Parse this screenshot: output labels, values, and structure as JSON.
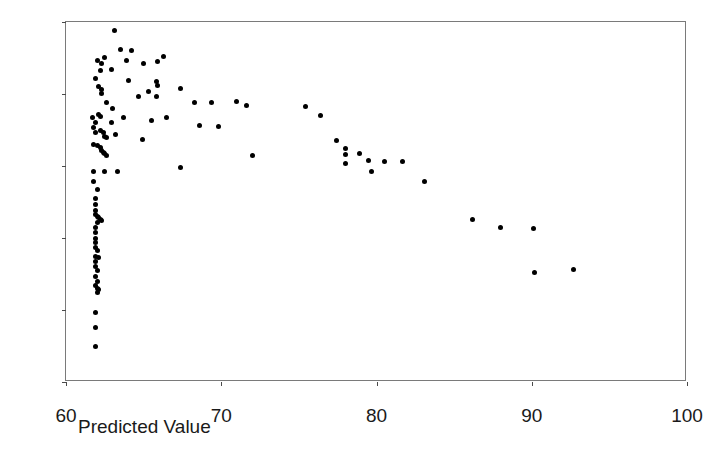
{
  "chart_data": {
    "type": "scatter",
    "title": "",
    "xlabel": "Predicted Value",
    "ylabel": "Studentized Residual",
    "xlim": [
      60,
      100
    ],
    "ylim": [
      -3,
      2
    ],
    "xticks": [
      60,
      70,
      80,
      90,
      100
    ],
    "yticks": [
      2,
      1,
      0,
      -1,
      -2,
      -3
    ],
    "xtick_labels": [
      "60",
      "70",
      "80",
      "90",
      "100"
    ],
    "ytick_labels": [
      "2",
      "1",
      "0",
      "-1",
      "-2",
      "-3"
    ],
    "grid": false,
    "legend": null,
    "marker": "filled-circle",
    "marker_color": "#000000",
    "n_points": 108,
    "points": [
      [
        63.1,
        1.88
      ],
      [
        63.5,
        1.62
      ],
      [
        64.2,
        1.6
      ],
      [
        62.0,
        1.47
      ],
      [
        62.5,
        1.51
      ],
      [
        66.3,
        1.52
      ],
      [
        62.3,
        1.43
      ],
      [
        63.9,
        1.46
      ],
      [
        65.0,
        1.43
      ],
      [
        65.9,
        1.45
      ],
      [
        62.2,
        1.33
      ],
      [
        62.9,
        1.34
      ],
      [
        61.9,
        1.21
      ],
      [
        64.0,
        1.19
      ],
      [
        65.8,
        1.17
      ],
      [
        65.9,
        1.12
      ],
      [
        62.1,
        1.11
      ],
      [
        62.3,
        1.06
      ],
      [
        65.3,
        1.04
      ],
      [
        67.4,
        1.07
      ],
      [
        62.3,
        1.01
      ],
      [
        64.7,
        0.97
      ],
      [
        65.8,
        0.96
      ],
      [
        62.6,
        0.88
      ],
      [
        68.3,
        0.88
      ],
      [
        69.4,
        0.88
      ],
      [
        71.0,
        0.9
      ],
      [
        71.6,
        0.84
      ],
      [
        75.4,
        0.82
      ],
      [
        63.0,
        0.8
      ],
      [
        76.4,
        0.7
      ],
      [
        61.7,
        0.68
      ],
      [
        62.1,
        0.71
      ],
      [
        62.2,
        0.69
      ],
      [
        63.7,
        0.68
      ],
      [
        65.5,
        0.63
      ],
      [
        66.5,
        0.67
      ],
      [
        61.9,
        0.6
      ],
      [
        62.9,
        0.6
      ],
      [
        61.8,
        0.54
      ],
      [
        68.6,
        0.56
      ],
      [
        69.8,
        0.55
      ],
      [
        62.2,
        0.5
      ],
      [
        62.4,
        0.46
      ],
      [
        61.9,
        0.47
      ],
      [
        63.2,
        0.44
      ],
      [
        62.5,
        0.41
      ],
      [
        62.6,
        0.4
      ],
      [
        64.9,
        0.37
      ],
      [
        77.4,
        0.35
      ],
      [
        61.8,
        0.3
      ],
      [
        62.0,
        0.29
      ],
      [
        62.2,
        0.26
      ],
      [
        62.3,
        0.22
      ],
      [
        78.0,
        0.25
      ],
      [
        62.4,
        0.19
      ],
      [
        62.5,
        0.17
      ],
      [
        62.6,
        0.15
      ],
      [
        72.0,
        0.14
      ],
      [
        78.0,
        0.16
      ],
      [
        78.9,
        0.17
      ],
      [
        79.5,
        0.07
      ],
      [
        80.5,
        0.06
      ],
      [
        81.7,
        0.06
      ],
      [
        78.0,
        0.03
      ],
      [
        67.4,
        -0.02
      ],
      [
        61.8,
        -0.07
      ],
      [
        62.5,
        -0.07
      ],
      [
        63.3,
        -0.07
      ],
      [
        79.7,
        -0.08
      ],
      [
        61.8,
        -0.21
      ],
      [
        83.1,
        -0.22
      ],
      [
        62.0,
        -0.33
      ],
      [
        61.9,
        -0.45
      ],
      [
        61.9,
        -0.54
      ],
      [
        61.9,
        -0.62
      ],
      [
        61.9,
        -0.68
      ],
      [
        62.0,
        -0.7
      ],
      [
        62.1,
        -0.72
      ],
      [
        62.2,
        -0.74
      ],
      [
        62.3,
        -0.76
      ],
      [
        62.0,
        -0.79
      ],
      [
        86.2,
        -0.74
      ],
      [
        61.9,
        -0.86
      ],
      [
        88.0,
        -0.85
      ],
      [
        90.1,
        -0.87
      ],
      [
        61.9,
        -0.93
      ],
      [
        61.9,
        -1.0
      ],
      [
        61.9,
        -1.06
      ],
      [
        61.9,
        -1.13
      ],
      [
        62.0,
        -1.18
      ],
      [
        61.9,
        -1.25
      ],
      [
        62.1,
        -1.27
      ],
      [
        61.9,
        -1.33
      ],
      [
        61.9,
        -1.4
      ],
      [
        62.0,
        -1.45
      ],
      [
        90.2,
        -1.48
      ],
      [
        92.7,
        -1.44
      ],
      [
        61.9,
        -1.53
      ],
      [
        62.0,
        -1.6
      ],
      [
        61.9,
        -1.66
      ],
      [
        62.0,
        -1.7
      ],
      [
        62.1,
        -1.72
      ],
      [
        62.0,
        -1.76
      ],
      [
        61.9,
        -2.03
      ],
      [
        61.9,
        -2.24
      ],
      [
        61.9,
        -2.51
      ]
    ]
  },
  "axes": {
    "x_title": "Predicted Value",
    "y_title": "Studentized Residual"
  }
}
